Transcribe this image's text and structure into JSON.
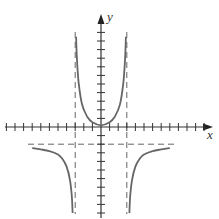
{
  "chart_data": {
    "type": "line",
    "title": "",
    "xlabel": "x",
    "ylabel": "y",
    "xlim": [
      -11,
      13
    ],
    "ylim": [
      -10.5,
      13
    ],
    "grid": false,
    "tick_spacing": 1,
    "x_ticks": [
      -11,
      -10,
      -9,
      -8,
      -7,
      -6,
      -5,
      -4,
      -3,
      -2,
      -1,
      1,
      2,
      3,
      4,
      5,
      6,
      7,
      8,
      9,
      10,
      11,
      12
    ],
    "y_ticks": [
      -10,
      -9,
      -8,
      -7,
      -6,
      -5,
      -4,
      -3,
      -2,
      -1,
      1,
      2,
      3,
      4,
      5,
      6,
      7,
      8,
      9,
      10,
      11
    ],
    "asymptotes": {
      "vertical": [
        -3,
        3
      ],
      "horizontal": [
        -2
      ]
    },
    "series": [
      {
        "name": "left-branch",
        "points": [
          [
            -8,
            -2.45
          ],
          [
            -7,
            -2.6
          ],
          [
            -6,
            -2.8
          ],
          [
            -5,
            -3.2
          ],
          [
            -4.5,
            -3.7
          ],
          [
            -4,
            -4.6
          ],
          [
            -3.6,
            -6.2
          ],
          [
            -3.4,
            -8
          ],
          [
            -3.3,
            -10
          ]
        ]
      },
      {
        "name": "middle-branch",
        "points": [
          [
            -2.9,
            10.5
          ],
          [
            -2.8,
            8
          ],
          [
            -2.6,
            5.2
          ],
          [
            -2.2,
            2.6
          ],
          [
            -1.6,
            1.2
          ],
          [
            -1,
            0.55
          ],
          [
            0,
            0.2
          ],
          [
            1,
            0.55
          ],
          [
            1.6,
            1.2
          ],
          [
            2.2,
            2.6
          ],
          [
            2.6,
            5.2
          ],
          [
            2.8,
            8
          ],
          [
            2.9,
            10.5
          ]
        ]
      },
      {
        "name": "right-branch",
        "points": [
          [
            3.3,
            -10
          ],
          [
            3.4,
            -8
          ],
          [
            3.6,
            -6.2
          ],
          [
            4,
            -4.6
          ],
          [
            4.5,
            -3.7
          ],
          [
            5,
            -3.2
          ],
          [
            6,
            -2.8
          ],
          [
            7,
            -2.6
          ],
          [
            8,
            -2.45
          ]
        ]
      }
    ],
    "colors": {
      "curve": "#666666",
      "axes": "#333333",
      "asymptote": "#666666"
    }
  },
  "labels": {
    "x_axis": "x",
    "y_axis": "y"
  }
}
